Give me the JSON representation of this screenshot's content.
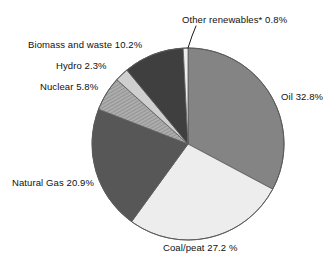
{
  "chart_data": {
    "type": "pie",
    "title": "",
    "subtitle": "",
    "xlabel": "",
    "ylabel": "",
    "legend_position": "none",
    "grid": false,
    "units": "percent",
    "labels_format": "{name} {value}%",
    "categories": [
      "Oil",
      "Coal/peat",
      "Natural Gas",
      "Nuclear",
      "Hydro",
      "Biomass and waste",
      "Other renewables*"
    ],
    "values": [
      32.8,
      27.2,
      20.9,
      5.8,
      2.3,
      10.2,
      0.8
    ],
    "total": 100.0,
    "start_angle_deg": 0,
    "direction": "clockwise",
    "slices": [
      {
        "name": "Oil",
        "value": 32.8,
        "label": "Oil 32.8%",
        "color": "#848484",
        "pattern": "solid",
        "start_deg": 0.0,
        "end_deg": 118.08
      },
      {
        "name": "Coal/peat",
        "value": 27.2,
        "label": "Coal/peat 27.2 %",
        "color": "#ededed",
        "pattern": "solid",
        "start_deg": 118.08,
        "end_deg": 216.0
      },
      {
        "name": "Natural Gas",
        "value": 20.9,
        "label": "Natural Gas 20.9%",
        "color": "#575757",
        "pattern": "solid",
        "start_deg": 216.0,
        "end_deg": 291.24
      },
      {
        "name": "Nuclear",
        "value": 5.8,
        "label": "Nuclear 5.8%",
        "color": "#9a9a9a",
        "pattern": "hatched",
        "start_deg": 291.24,
        "end_deg": 312.12
      },
      {
        "name": "Hydro",
        "value": 2.3,
        "label": "Hydro 2.3%",
        "color": "#cfcfcf",
        "pattern": "solid",
        "start_deg": 312.12,
        "end_deg": 320.4
      },
      {
        "name": "Biomass and waste",
        "value": 10.2,
        "label": "Biomass and waste 10.2%",
        "color": "#3f3f3f",
        "pattern": "solid",
        "start_deg": 320.4,
        "end_deg": 357.12
      },
      {
        "name": "Other renewables*",
        "value": 0.8,
        "label": "Other renewables* 0.8%",
        "color": "#ededed",
        "pattern": "solid",
        "start_deg": 357.12,
        "end_deg": 360.0
      }
    ],
    "annotations": [
      {
        "name": "other-renewables-leader-line",
        "for": "Other renewables*",
        "from_x": 188,
        "from_y": 48,
        "to_x": 195,
        "to_y": 26
      }
    ]
  },
  "geometry": {
    "center_x": 188,
    "center_y": 144,
    "radius": 96,
    "outline_color": "#5a5a5a"
  },
  "labels": {
    "oil": "Oil 32.8%",
    "coal": "Coal/peat 27.2 %",
    "natural_gas": "Natural Gas 20.9%",
    "nuclear": "Nuclear 5.8%",
    "hydro": "Hydro 2.3%",
    "biomass": "Biomass and waste 10.2%",
    "other_renewables": "Other renewables* 0.8%"
  }
}
